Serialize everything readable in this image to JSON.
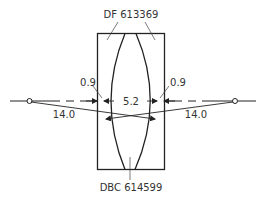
{
  "diagram": {
    "type": "lens-cross-section",
    "labels": {
      "top_glass": "DF 613369",
      "bottom_glass": "DBC 614599",
      "left_thickness": "0.9",
      "right_thickness": "0.9",
      "center_thickness": "5.2",
      "left_focal_distance": "14.0",
      "right_focal_distance": "14.0"
    },
    "colors": {
      "line": "#222222",
      "text": "#333333",
      "background": "#ffffff"
    }
  }
}
